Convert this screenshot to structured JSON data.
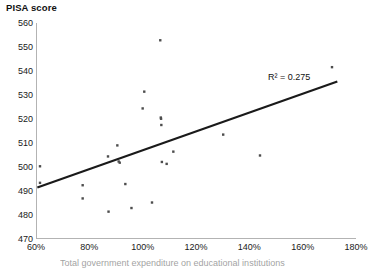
{
  "chart_data": {
    "type": "scatter",
    "title": "PISA score",
    "xlabel": "",
    "ylabel": "PISA score",
    "xlim": [
      60,
      180
    ],
    "ylim": [
      470,
      560
    ],
    "x_ticks": [
      60,
      80,
      100,
      120,
      140,
      160,
      180
    ],
    "x_tick_labels": [
      "60%",
      "80%",
      "100%",
      "120%",
      "140%",
      "160%",
      "180%"
    ],
    "y_ticks": [
      470,
      480,
      490,
      500,
      510,
      520,
      530,
      540,
      550,
      560
    ],
    "y_tick_labels": [
      "470",
      "480",
      "490",
      "500",
      "510",
      "520",
      "530",
      "540",
      "550",
      "560"
    ],
    "grid": false,
    "legend": "none",
    "marker_color": "#4d4d4d",
    "marker_size": 2.4,
    "points": [
      {
        "x": 61.5,
        "y": 500.3
      },
      {
        "x": 61.5,
        "y": 493.4
      },
      {
        "x": 77.5,
        "y": 492.4
      },
      {
        "x": 77.5,
        "y": 486.9
      },
      {
        "x": 87.0,
        "y": 504.4
      },
      {
        "x": 87.2,
        "y": 481.4
      },
      {
        "x": 90.5,
        "y": 509.0
      },
      {
        "x": 91.0,
        "y": 502.3
      },
      {
        "x": 91.4,
        "y": 501.8
      },
      {
        "x": 93.5,
        "y": 492.9
      },
      {
        "x": 95.8,
        "y": 482.9
      },
      {
        "x": 100.0,
        "y": 524.4
      },
      {
        "x": 100.6,
        "y": 531.4
      },
      {
        "x": 103.5,
        "y": 485.2
      },
      {
        "x": 106.6,
        "y": 552.8
      },
      {
        "x": 106.8,
        "y": 520.6
      },
      {
        "x": 106.9,
        "y": 520.1
      },
      {
        "x": 107.0,
        "y": 517.5
      },
      {
        "x": 107.2,
        "y": 502.1
      },
      {
        "x": 109.0,
        "y": 501.3
      },
      {
        "x": 111.5,
        "y": 506.4
      },
      {
        "x": 130.2,
        "y": 513.5
      },
      {
        "x": 144.0,
        "y": 504.8
      },
      {
        "x": 171.0,
        "y": 541.6
      }
    ],
    "trendline": {
      "type": "linear",
      "r_squared_label": "R² = 0.275",
      "r_squared": 0.275,
      "color": "#1a1a1a",
      "x_start": 60.5,
      "y_start": 491.5,
      "x_end": 173.0,
      "y_end": 535.6
    },
    "caption_partial": "Total government expenditure on educational institutions"
  }
}
